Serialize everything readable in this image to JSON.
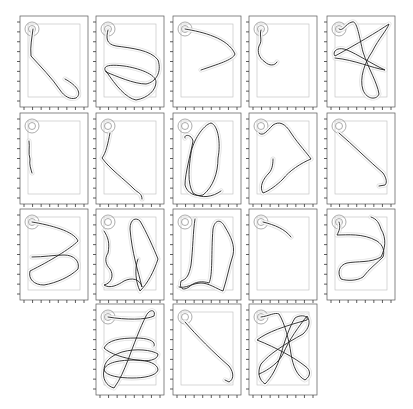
{
  "figure": {
    "layout": "grid of 18 trajectory panels (rows: 5,5,5,3)",
    "colors": {
      "trajectory": "#222222",
      "halo": "#c8c8c8",
      "frame": "#555555",
      "inner_box": "#bdbdbd",
      "start_circle": "#8a8a8a"
    }
  },
  "chart_data": {
    "type": "line",
    "title": "",
    "xlabel": "",
    "ylabel": "",
    "grid": false,
    "legend": "none",
    "panel_coordinate_space": {
      "width": 68,
      "height": 91
    },
    "panels": [
      {
        "id": 1,
        "row": 1,
        "col": 1,
        "path": "M13,13 C12,22 10,30 11,40 C20,50 32,62 40,74 C44,80 50,84 56,82 C62,78 58,70 45,63"
      },
      {
        "id": 2,
        "row": 1,
        "col": 2,
        "path": "M12,14 C10,22 10,28 20,30 C35,32 55,34 62,44 C66,56 60,66 50,68 C38,68 20,60 10,56 C6,50 12,48 28,50 C42,52 60,58 60,66 C60,74 52,82 40,84 C30,82 20,70 10,55"
      },
      {
        "id": 3,
        "row": 1,
        "col": 3,
        "path": "M12,13 C30,16 55,22 62,38 C60,44 45,48 28,54"
      },
      {
        "id": 4,
        "row": 1,
        "col": 4,
        "path": "M12,14 C10,20 14,24 10,30 C8,36 10,42 16,46 C20,50 26,50 28,46"
      },
      {
        "id": 5,
        "row": 1,
        "col": 5,
        "path": "M12,13 C16,16 18,8 25,6 C30,4 32,20 36,36 C42,54 50,66 52,78 C50,84 40,84 36,74 C32,62 38,46 45,36 C52,22 60,14 62,8 C50,16 30,28 8,40 C5,36 10,30 20,34 C30,38 45,48 58,54 C45,52 28,44 8,42"
      },
      {
        "id": 6,
        "row": 2,
        "col": 1,
        "path": "M9,28 C10,34 8,40 10,46 C9,52 11,56 12,60"
      },
      {
        "id": 7,
        "row": 2,
        "col": 2,
        "path": "M14,20 C12,30 10,40 6,45 C14,56 28,66 38,76 C42,80 46,80 46,86"
      },
      {
        "id": 8,
        "row": 2,
        "col": 3,
        "path": "M12,25 C10,22 18,20 20,28 C18,40 12,60 12,72 C14,80 22,84 30,82 C40,74 45,60 45,45 C48,30 45,12 38,10 C30,12 20,28 18,40 C16,54 14,70 20,80 C28,86 40,84 48,78"
      },
      {
        "id": 9,
        "row": 2,
        "col": 4,
        "path": "M10,20 C14,24 18,18 24,12 C30,8 36,10 42,20 C50,32 58,40 62,46 C52,50 40,58 34,66 C28,72 20,78 14,80 C10,74 14,66 20,60 C24,56 24,48 24,46"
      },
      {
        "id": 10,
        "row": 2,
        "col": 5,
        "path": "M12,20 C26,32 42,48 56,60 C60,66 60,70 58,72 L52,73"
      },
      {
        "id": 11,
        "row": 3,
        "col": 1,
        "path": "M12,13 C30,16 54,22 58,32 C50,40 30,52 10,62 C8,70 14,76 24,76 C36,74 50,68 58,60 C60,52 54,46 44,46 C34,46 24,48 12,48"
      },
      {
        "id": 12,
        "row": 3,
        "col": 2,
        "path": "M8,22 C12,28 14,34 12,44 C8,50 10,56 14,60 C18,66 16,74 8,76 C14,80 22,76 28,72 C36,68 44,70 46,78 C42,62 36,44 34,20 C34,10 40,8 44,12 C50,22 58,40 62,50 C58,62 52,74 44,82 C40,74 38,60 42,50"
      },
      {
        "id": 13,
        "row": 3,
        "col": 3,
        "path": "M22,10 C20,22 20,40 18,56 C16,66 14,70 8,72 C6,80 10,82 16,78 C22,72 30,72 36,74 C40,66 38,44 40,20 C42,10 48,10 52,18 C58,28 62,36 60,46 C56,58 54,70 50,82 C44,80 36,74 28,74 C20,74 12,80 6,78"
      },
      {
        "id": 14,
        "row": 3,
        "col": 4,
        "path": "M14,13 C26,16 36,20 42,28"
      },
      {
        "id": 15,
        "row": 3,
        "col": 5,
        "path": "M12,13 C14,18 12,22 10,26 C20,26 36,24 50,32 C56,36 58,42 56,48 C50,54 42,60 36,68 C30,72 20,72 14,70 C10,64 12,56 20,54 C30,52 44,54 54,48 C58,40 60,30 54,20 C52,14 50,10 44,8"
      },
      {
        "id": 16,
        "row": 4,
        "col": 2,
        "path": "M12,13 C30,16 50,16 58,12 C60,6 54,4 50,12 C44,24 38,40 32,56 C28,66 24,76 18,84 C10,82 6,74 8,66 C10,58 24,56 40,56 C52,56 62,60 62,66 C60,72 48,74 36,74 C24,74 10,72 8,66 C8,58 14,52 26,48 C40,44 56,46 62,50 C62,56 52,58 40,56 C28,54 14,50 8,44 C12,36 24,34 40,34 C54,34 60,38 58,42"
      },
      {
        "id": 17,
        "row": 4,
        "col": 3,
        "path": "M12,18 C24,32 40,48 56,62 C62,70 60,76 56,78 L52,76"
      },
      {
        "id": 18,
        "row": 4,
        "col": 4,
        "path": "M12,13 C20,12 26,8 30,10 C36,20 40,36 42,50 C44,62 48,72 56,76 C62,72 62,66 56,62 C46,54 28,44 8,36 C18,28 36,22 58,16 C60,12 52,10 46,14 C40,24 36,36 32,50 C28,64 22,74 16,80 C10,76 8,68 12,60 C20,50 36,40 54,30 C60,24 62,18 58,12 C50,22 40,36 34,50 C30,58 20,66 10,70"
      }
    ]
  }
}
